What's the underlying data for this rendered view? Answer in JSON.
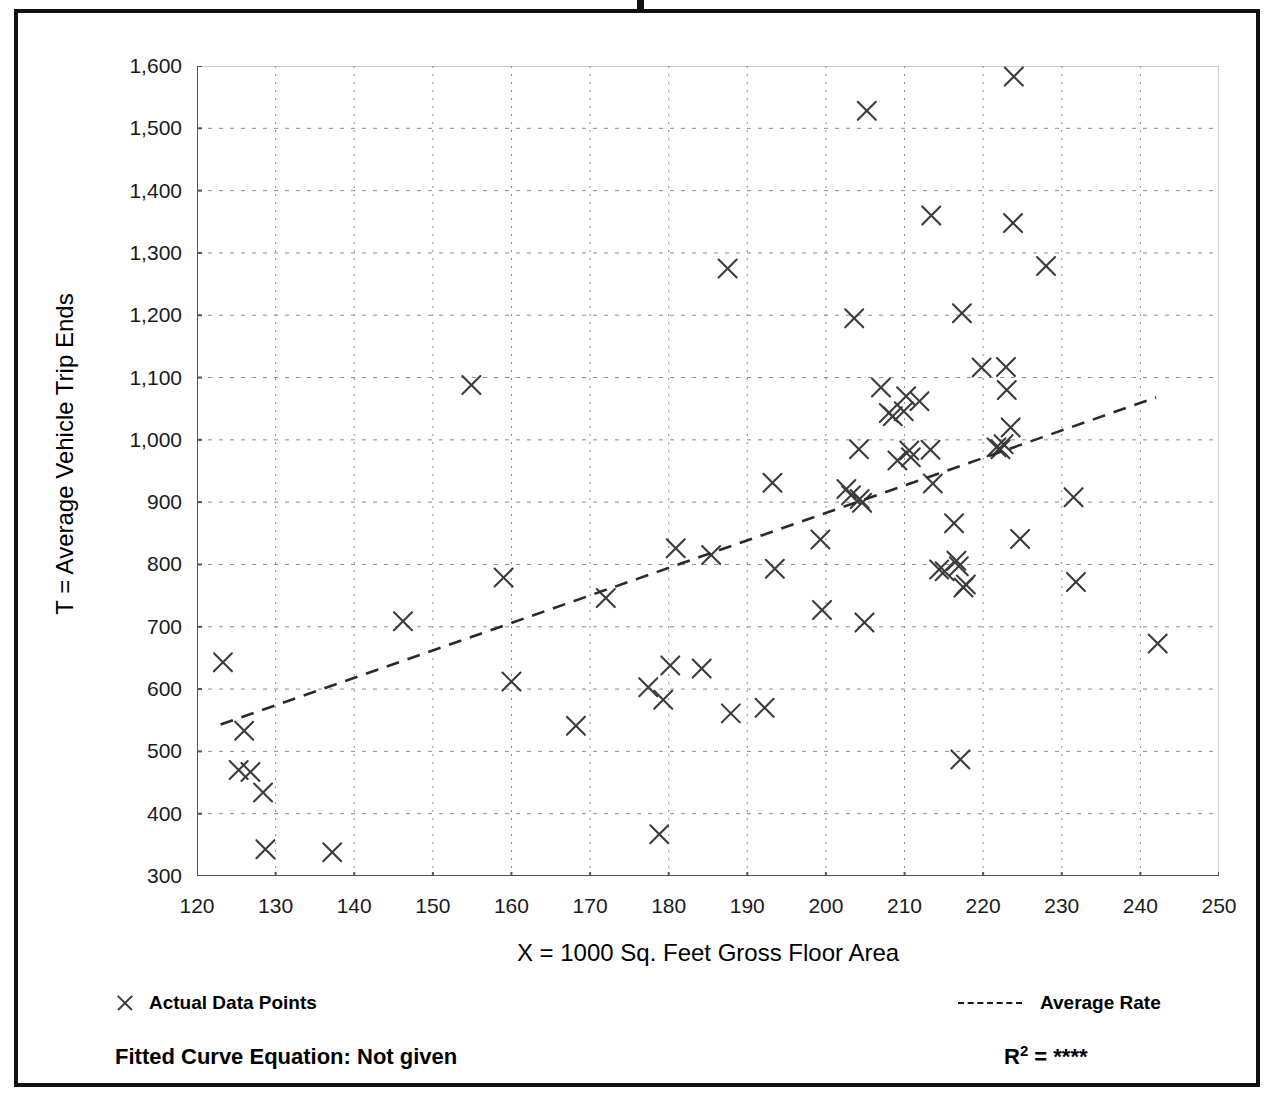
{
  "chart_data": {
    "type": "scatter",
    "title": "",
    "xlabel": "X = 1000 Sq. Feet Gross Floor Area",
    "ylabel": "T = Average Vehicle Trip Ends",
    "xlim": [
      120,
      250
    ],
    "ylim": [
      300,
      1600
    ],
    "x_ticks": [
      120,
      130,
      140,
      150,
      160,
      170,
      180,
      190,
      200,
      210,
      220,
      230,
      240,
      250
    ],
    "x_tick_labels": [
      "120",
      "130",
      "140",
      "150",
      "160",
      "170",
      "180",
      "190",
      "200",
      "210",
      "220",
      "230",
      "240",
      "250"
    ],
    "x_minor_tick_step": 5,
    "y_ticks": [
      300,
      400,
      500,
      600,
      700,
      800,
      900,
      1000,
      1100,
      1200,
      1300,
      1400,
      1500,
      1600
    ],
    "y_tick_labels": [
      "300",
      "400",
      "500",
      "600",
      "700",
      "800",
      "900",
      "1,000",
      "1,100",
      "1,200",
      "1,300",
      "1,400",
      "1,500",
      "1,600"
    ],
    "y_minor_tick_step": 50,
    "grid": true,
    "grid_style": "dotted",
    "grid_x_step": 10,
    "grid_y_step": 100,
    "marker": "x",
    "marker_color": "#3b3b3b",
    "legend_position": "below-plot",
    "series": [
      {
        "name": "Actual Data Points",
        "type": "scatter",
        "points": [
          [
            123.3,
            643
          ],
          [
            126.0,
            533
          ],
          [
            125.3,
            470
          ],
          [
            126.8,
            467
          ],
          [
            128.4,
            434
          ],
          [
            128.7,
            343
          ],
          [
            137.2,
            338
          ],
          [
            146.2,
            709
          ],
          [
            154.9,
            1088
          ],
          [
            159.0,
            779
          ],
          [
            160.0,
            612
          ],
          [
            168.2,
            541
          ],
          [
            172.0,
            746
          ],
          [
            177.4,
            603
          ],
          [
            178.8,
            367
          ],
          [
            179.3,
            583
          ],
          [
            180.9,
            826
          ],
          [
            180.2,
            638
          ],
          [
            184.2,
            633
          ],
          [
            185.4,
            815
          ],
          [
            187.5,
            1275
          ],
          [
            187.9,
            561
          ],
          [
            192.2,
            570
          ],
          [
            193.2,
            931
          ],
          [
            193.5,
            793
          ],
          [
            199.3,
            840
          ],
          [
            199.5,
            727
          ],
          [
            202.6,
            921
          ],
          [
            203.2,
            911
          ],
          [
            203.6,
            1195
          ],
          [
            204.2,
            985
          ],
          [
            204.6,
            899
          ],
          [
            204.3,
            905
          ],
          [
            204.9,
            707
          ],
          [
            205.2,
            1528
          ],
          [
            207.0,
            1084
          ],
          [
            208.0,
            1043
          ],
          [
            208.5,
            1038
          ],
          [
            209.1,
            967
          ],
          [
            209.9,
            1046
          ],
          [
            210.2,
            1070
          ],
          [
            210.6,
            983
          ],
          [
            210.8,
            972
          ],
          [
            211.9,
            1062
          ],
          [
            213.3,
            984
          ],
          [
            213.6,
            930
          ],
          [
            214.4,
            792
          ],
          [
            215.1,
            789
          ],
          [
            216.3,
            866
          ],
          [
            216.6,
            806
          ],
          [
            216.9,
            797
          ],
          [
            217.1,
            487
          ],
          [
            217.3,
            1203
          ],
          [
            217.5,
            763
          ],
          [
            217.8,
            768
          ],
          [
            219.8,
            1116
          ],
          [
            221.7,
            988
          ],
          [
            222.2,
            985
          ],
          [
            222.6,
            993
          ],
          [
            222.9,
            1117
          ],
          [
            223.0,
            1080
          ],
          [
            223.5,
            1020
          ],
          [
            223.8,
            1348
          ],
          [
            223.9,
            1583
          ],
          [
            224.7,
            841
          ],
          [
            213.4,
            1360
          ],
          [
            228.0,
            1279
          ],
          [
            231.5,
            908
          ],
          [
            231.8,
            772
          ],
          [
            242.2,
            673
          ]
        ]
      },
      {
        "name": "Average Rate",
        "type": "line",
        "style": "dashed",
        "points": [
          [
            123.0,
            543
          ],
          [
            242.0,
            1068
          ]
        ]
      }
    ]
  },
  "axis": {
    "y_title": "T = Average Vehicle Trip Ends",
    "x_title": "X = 1000 Sq. Feet Gross Floor Area"
  },
  "legend": {
    "data_points_label": "Actual Data Points",
    "average_rate_label": "Average Rate",
    "marker_icon": "x-marker-icon",
    "line_icon": "dashed-line-icon"
  },
  "footer": {
    "equation_label": "Fitted Curve Equation:  Not given",
    "r_squared_prefix": "R",
    "r_squared_exponent": "2",
    "r_squared_equals": " = ",
    "r_squared_value": "****"
  },
  "colors": {
    "marker": "#3b3b3b",
    "axis": "#555555",
    "grid": "#8c8c8c",
    "frame": "#111111",
    "text": "#000000"
  }
}
